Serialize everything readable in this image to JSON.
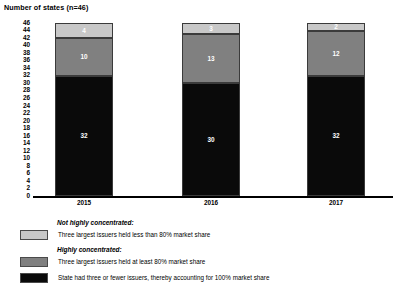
{
  "chart_data": {
    "type": "bar",
    "subtype": "stacked-vertical",
    "title": "Number of states (n=46)",
    "xlabel": "",
    "ylabel": "Number of states (n=46)",
    "categories": [
      "2015",
      "2016",
      "2017"
    ],
    "ylim": [
      0,
      46
    ],
    "ytick_step": 2,
    "yticks": [
      46,
      44,
      42,
      40,
      38,
      36,
      34,
      32,
      30,
      28,
      26,
      24,
      22,
      20,
      18,
      16,
      14,
      12,
      10,
      8,
      6,
      4,
      2,
      0
    ],
    "grid": false,
    "legend_position": "below",
    "series": [
      {
        "name": "State had three or fewer issuers, thereby accounting for 100% market share",
        "color": "#0a0a0a",
        "values": [
          32,
          30,
          32
        ]
      },
      {
        "name": "Three largest issuers held at least 80% market share",
        "color": "#808080",
        "values": [
          10,
          13,
          12
        ]
      },
      {
        "name": "Three largest issuers held less than 80% market share",
        "color": "#c8c8c8",
        "values": [
          4,
          3,
          2
        ]
      }
    ],
    "totals": [
      46,
      46,
      46
    ]
  },
  "legend": {
    "group_not_concentrated": "Not highly concentrated:",
    "group_highly_concentrated": "Highly concentrated:",
    "item_light": "Three largest issuers held less than 80% market share",
    "item_mid": "Three largest issuers held at least 80% market share",
    "item_dark": "State had three or fewer issuers, thereby accounting for 100% market share"
  },
  "colors": {
    "light": "#c8c8c8",
    "mid": "#808080",
    "dark": "#0a0a0a",
    "axis": "#000000",
    "segment_border": "#3b3b3b",
    "label_text": "#ffffff"
  }
}
